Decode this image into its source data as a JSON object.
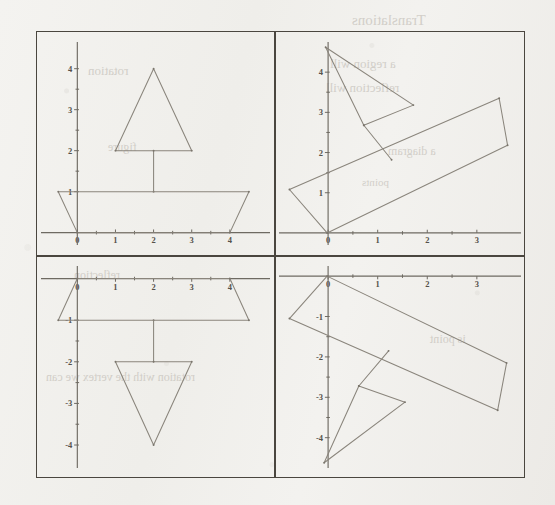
{
  "page": {
    "background_color": "#f2f1ee",
    "frame_border_color": "#4a463f",
    "axis_color": "#6e6a62",
    "shape_color": "#8a857c",
    "label_color": "#55514a"
  },
  "bleed_through_text": [
    {
      "text": "Translations",
      "x": 352,
      "y": 12,
      "size": 15
    },
    {
      "text": "a region will",
      "x": 330,
      "y": 56,
      "size": 13
    },
    {
      "text": "reflection will",
      "x": 326,
      "y": 80,
      "size": 13
    },
    {
      "text": "a diagram",
      "x": 388,
      "y": 144,
      "size": 12
    },
    {
      "text": "points",
      "x": 362,
      "y": 176,
      "size": 11
    },
    {
      "text": "rotation",
      "x": 88,
      "y": 63,
      "size": 13
    },
    {
      "text": "figure",
      "x": 108,
      "y": 140,
      "size": 12
    },
    {
      "text": "reflection",
      "x": 74,
      "y": 268,
      "size": 12
    },
    {
      "text": "rotation with the vertex we can",
      "x": 46,
      "y": 370,
      "size": 12
    },
    {
      "text": "is point",
      "x": 430,
      "y": 332,
      "size": 12
    }
  ],
  "figure": {
    "name": "four-panel-transformation-figure",
    "panels": [
      {
        "id": "top-left",
        "name": "original-figure",
        "axes": {
          "x_labels": [
            "0",
            "1",
            "2",
            "3",
            "4"
          ],
          "x_values": [
            0,
            1,
            2,
            3,
            4
          ],
          "y_labels": [
            "1",
            "2",
            "3",
            "4"
          ],
          "y_values": [
            1,
            2,
            3,
            4
          ],
          "x_axis_position": "bottom",
          "y_axis_position": "left",
          "xlim": [
            -0.9,
            5.0
          ],
          "ylim": [
            -0.35,
            4.7
          ]
        },
        "shapes": [
          {
            "name": "sail-triangle",
            "type": "polygon",
            "points": [
              [
                2,
                4
              ],
              [
                1,
                2
              ],
              [
                3,
                2
              ]
            ]
          },
          {
            "name": "mast-segment",
            "type": "line",
            "points": [
              [
                2,
                2
              ],
              [
                2,
                1
              ]
            ]
          },
          {
            "name": "hull-trapezoid",
            "type": "polygon",
            "points": [
              [
                -0.5,
                1
              ],
              [
                4.5,
                1
              ],
              [
                4,
                0
              ],
              [
                0,
                0
              ]
            ]
          }
        ]
      },
      {
        "id": "top-right",
        "name": "rotated-figure",
        "axes": {
          "x_labels": [
            "0",
            "1",
            "2",
            "3"
          ],
          "x_values": [
            0,
            1,
            2,
            3
          ],
          "y_labels": [
            "1",
            "2",
            "3",
            "4"
          ],
          "y_values": [
            1,
            2,
            3,
            4
          ],
          "x_axis_position": "bottom",
          "y_axis_position": "left",
          "xlim": [
            -0.95,
            3.85
          ],
          "ylim": [
            -0.35,
            4.8
          ]
        },
        "shapes": [
          {
            "name": "sail-triangle",
            "type": "polygon",
            "points": [
              [
                -0.05,
                4.62
              ],
              [
                1.72,
                3.18
              ],
              [
                0.72,
                2.68
              ]
            ]
          },
          {
            "name": "mast-segment",
            "type": "line",
            "points": [
              [
                0.72,
                2.68
              ],
              [
                1.28,
                1.82
              ]
            ]
          },
          {
            "name": "hull-trapezoid",
            "type": "polygon",
            "points": [
              [
                -0.78,
                1.08
              ],
              [
                3.45,
                3.35
              ],
              [
                3.62,
                2.18
              ],
              [
                -0.02,
                0.0
              ]
            ]
          }
        ]
      },
      {
        "id": "bottom-left",
        "name": "reflected-figure",
        "axes": {
          "x_labels": [
            "0",
            "1",
            "2",
            "3",
            "4"
          ],
          "x_values": [
            0,
            1,
            2,
            3,
            4
          ],
          "y_labels": [
            "-1",
            "-2",
            "-3",
            "-4"
          ],
          "y_values": [
            -1,
            -2,
            -3,
            -4
          ],
          "x_axis_position": "top",
          "y_axis_position": "left",
          "xlim": [
            -0.9,
            5.0
          ],
          "ylim": [
            -4.6,
            0.35
          ]
        },
        "shapes": [
          {
            "name": "sail-triangle",
            "type": "polygon",
            "points": [
              [
                2,
                -4
              ],
              [
                1,
                -2
              ],
              [
                3,
                -2
              ]
            ]
          },
          {
            "name": "mast-segment",
            "type": "line",
            "points": [
              [
                2,
                -2
              ],
              [
                2,
                -1
              ]
            ]
          },
          {
            "name": "hull-trapezoid",
            "type": "polygon",
            "points": [
              [
                -0.5,
                -1
              ],
              [
                4.5,
                -1
              ],
              [
                4,
                0
              ],
              [
                0,
                0
              ]
            ]
          }
        ]
      },
      {
        "id": "bottom-right",
        "name": "rotated-reflected-figure",
        "axes": {
          "x_labels": [
            "0",
            "1",
            "2",
            "3"
          ],
          "x_values": [
            0,
            1,
            2,
            3
          ],
          "y_labels": [
            "-1",
            "-2",
            "-3",
            "-4"
          ],
          "y_values": [
            -1,
            -2,
            -3,
            -4
          ],
          "x_axis_position": "top",
          "y_axis_position": "left",
          "xlim": [
            -0.95,
            3.85
          ],
          "ylim": [
            -4.8,
            0.3
          ]
        },
        "shapes": [
          {
            "name": "sail-triangle",
            "type": "polygon",
            "points": [
              [
                -0.08,
                -4.62
              ],
              [
                1.55,
                -3.12
              ],
              [
                0.62,
                -2.72
              ]
            ]
          },
          {
            "name": "mast-segment",
            "type": "line",
            "points": [
              [
                0.62,
                -2.72
              ],
              [
                1.22,
                -1.85
              ]
            ]
          },
          {
            "name": "hull-trapezoid",
            "type": "polygon",
            "points": [
              [
                -0.78,
                -1.05
              ],
              [
                3.42,
                -3.32
              ],
              [
                3.6,
                -2.15
              ],
              [
                -0.02,
                0.0
              ]
            ]
          }
        ]
      }
    ]
  }
}
